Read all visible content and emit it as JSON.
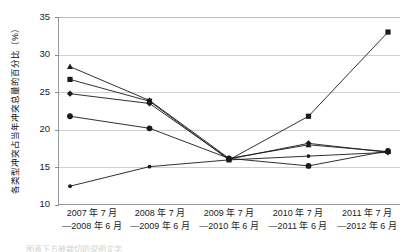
{
  "chart_data": {
    "type": "line",
    "title": "",
    "xlabel": "",
    "ylabel": "各类型冲突占当年冲突总量的百分比（%）",
    "ylim": [
      10,
      35
    ],
    "yticks": [
      10,
      15,
      20,
      25,
      30,
      35
    ],
    "grid": true,
    "legend": "none",
    "categories": [
      "2007 年 7 月—2008 年 6 月",
      "2008 年 7 月—2009 年 6 月",
      "2009 年 7 月—2010 年 6 月",
      "2010 年 7 月—2011 年 6 月",
      "2011 年 7 月—2012 年 6 月"
    ],
    "category_lines": [
      {
        "line1": "2007 年 7 月",
        "line2": "—2008 年 6 月"
      },
      {
        "line1": "2008 年 7 月",
        "line2": "—2009 年 6 月"
      },
      {
        "line1": "2009 年 7 月",
        "line2": "—2010 年 6 月"
      },
      {
        "line1": "2010 年 7 月",
        "line2": "—2011 年 6 月"
      },
      {
        "line1": "2011 年 7 月",
        "line2": "—2012 年 6 月"
      }
    ],
    "series": [
      {
        "name": "series-1",
        "marker": "triangle",
        "values": [
          28.4,
          23.9,
          16.2,
          18.0,
          17.1
        ]
      },
      {
        "name": "series-2",
        "marker": "square",
        "values": [
          26.7,
          23.8,
          16.0,
          21.8,
          33.0
        ]
      },
      {
        "name": "series-3",
        "marker": "diamond",
        "values": [
          24.8,
          23.5,
          16.1,
          18.2,
          17.0
        ]
      },
      {
        "name": "series-4",
        "marker": "circle",
        "values": [
          21.8,
          20.2,
          16.2,
          15.2,
          17.2
        ]
      },
      {
        "name": "series-5",
        "marker": "dot",
        "values": [
          12.5,
          15.1,
          16.0,
          16.5,
          17.0
        ]
      }
    ]
  },
  "axis": {
    "y_tick_labels": [
      "35",
      "30",
      "25",
      "20",
      "15",
      "10"
    ],
    "y_title": "各类型冲突占当年冲突总量的百分比（%）"
  },
  "caption": {
    "text": "图表下方被裁切的说明文字"
  },
  "colors": {
    "line": "#1a1a1a",
    "grid": "#cfcfcf",
    "axis": "#9a9a9a",
    "text": "#1a1a1a"
  }
}
